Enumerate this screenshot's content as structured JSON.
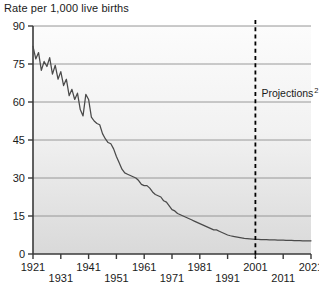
{
  "chart_data": {
    "type": "line",
    "title": "Rate per 1,000 live births",
    "xlabel": "",
    "ylabel": "",
    "ylim": [
      0,
      90
    ],
    "xlim": [
      1921,
      2021
    ],
    "yticks": [
      0,
      15,
      30,
      45,
      60,
      75,
      90
    ],
    "xticks": [
      1921,
      1931,
      1941,
      1951,
      1961,
      1971,
      1981,
      1991,
      2001,
      2011,
      2021
    ],
    "grid": true,
    "legend": "none",
    "annotations": [
      {
        "name": "projections-divider",
        "text": "Projections",
        "superscript": "2",
        "x": 2001,
        "style": "dashed-vertical-line"
      }
    ],
    "series": [
      {
        "name": "Infant mortality rate",
        "x": [
          1921,
          1922,
          1923,
          1924,
          1925,
          1926,
          1927,
          1928,
          1929,
          1930,
          1931,
          1932,
          1933,
          1934,
          1935,
          1936,
          1937,
          1938,
          1939,
          1940,
          1941,
          1942,
          1943,
          1944,
          1945,
          1946,
          1947,
          1948,
          1949,
          1950,
          1951,
          1952,
          1953,
          1954,
          1955,
          1956,
          1957,
          1958,
          1959,
          1960,
          1961,
          1962,
          1963,
          1964,
          1965,
          1966,
          1967,
          1968,
          1969,
          1970,
          1971,
          1972,
          1973,
          1974,
          1975,
          1976,
          1977,
          1978,
          1979,
          1980,
          1981,
          1982,
          1983,
          1984,
          1985,
          1986,
          1987,
          1988,
          1989,
          1990,
          1991,
          1992,
          1993,
          1994,
          1995,
          1996,
          1997,
          1998,
          1999,
          2000,
          2001,
          2002,
          2003,
          2004,
          2005,
          2006,
          2007,
          2008,
          2009,
          2010,
          2011,
          2012,
          2013,
          2014,
          2015,
          2016,
          2017,
          2018,
          2019,
          2020,
          2021
        ],
        "y": [
          82.0,
          77.0,
          79.5,
          72.5,
          76.0,
          74.0,
          77.5,
          71.0,
          74.5,
          69.0,
          72.0,
          66.5,
          69.0,
          62.5,
          65.0,
          61.0,
          63.5,
          57.0,
          54.5,
          63.0,
          61.0,
          54.0,
          52.5,
          51.5,
          51.0,
          47.5,
          45.5,
          44.0,
          43.5,
          41.5,
          38.5,
          36.0,
          33.5,
          32.0,
          31.5,
          31.0,
          30.5,
          30.0,
          29.0,
          27.5,
          27.0,
          27.0,
          26.0,
          24.5,
          23.5,
          23.0,
          22.5,
          21.0,
          20.5,
          19.0,
          17.5,
          17.0,
          16.0,
          15.5,
          15.0,
          14.5,
          14.0,
          13.5,
          13.0,
          12.5,
          12.0,
          11.5,
          11.0,
          10.5,
          10.0,
          9.5,
          9.5,
          9.0,
          8.5,
          8.0,
          7.5,
          7.2,
          7.0,
          6.8,
          6.6,
          6.4,
          6.2,
          6.1,
          6.0,
          5.9,
          5.8,
          5.8,
          5.7,
          5.7,
          5.7,
          5.6,
          5.6,
          5.6,
          5.5,
          5.5,
          5.5,
          5.4,
          5.4,
          5.4,
          5.3,
          5.3,
          5.3,
          5.2,
          5.2,
          5.2,
          5.2
        ]
      }
    ]
  }
}
